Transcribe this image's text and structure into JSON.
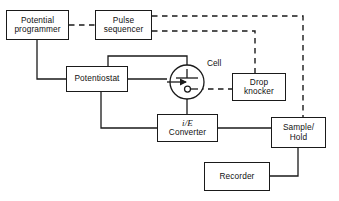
{
  "diagram": {
    "canvas": {
      "width": 339,
      "height": 201,
      "background": "#ffffff"
    },
    "line_colors": {
      "solid": "#1a1a1a",
      "dashed": "#1a1a1a"
    },
    "nodes": [
      {
        "id": "potential-programmer",
        "label_lines": [
          "Potential",
          "programmer"
        ],
        "x": 6,
        "y": 10,
        "w": 63,
        "h": 30
      },
      {
        "id": "pulse-sequencer",
        "label_lines": [
          "Pulse",
          "sequencer"
        ],
        "x": 95,
        "y": 10,
        "w": 57,
        "h": 30
      },
      {
        "id": "potentiostat",
        "label_lines": [
          "Potentiostat"
        ],
        "x": 66,
        "y": 66,
        "w": 62,
        "h": 26
      },
      {
        "id": "drop-knocker",
        "label_lines": [
          "Drop",
          "knocker"
        ],
        "x": 232,
        "y": 73,
        "w": 54,
        "h": 28
      },
      {
        "id": "ie-converter",
        "label_lines": [
          "i/E",
          "Converter"
        ],
        "italic_first_line": true,
        "x": 157,
        "y": 114,
        "w": 61,
        "h": 28
      },
      {
        "id": "sample-hold",
        "label_lines": [
          "Sample/",
          "Hold"
        ],
        "x": 271,
        "y": 117,
        "w": 55,
        "h": 31
      },
      {
        "id": "recorder",
        "label_lines": [
          "Recorder"
        ],
        "x": 204,
        "y": 162,
        "w": 66,
        "h": 29
      }
    ],
    "cell": {
      "id": "cell",
      "label": "Cell",
      "label_x": 207,
      "label_y": 63,
      "cx": 187,
      "cy": 82,
      "r": 17
    },
    "connections": [
      {
        "from": "potential-programmer",
        "to": "pulse-sequencer",
        "style": "dashed"
      },
      {
        "from": "potential-programmer",
        "to": "potentiostat",
        "style": "solid"
      },
      {
        "from": "pulse-sequencer",
        "to": "sample-hold",
        "style": "dashed"
      },
      {
        "from": "pulse-sequencer",
        "to": "drop-knocker",
        "style": "dashed"
      },
      {
        "from": "cell",
        "to": "drop-knocker",
        "style": "dashed"
      },
      {
        "from": "potentiostat",
        "to": "cell",
        "style": "solid"
      },
      {
        "from": "potentiostat",
        "to": "cell-top-electrode",
        "style": "solid"
      },
      {
        "from": "potentiostat",
        "to": "ie-converter",
        "style": "solid"
      },
      {
        "from": "cell",
        "to": "ie-converter",
        "style": "solid"
      },
      {
        "from": "ie-converter",
        "to": "sample-hold",
        "style": "solid"
      },
      {
        "from": "sample-hold",
        "to": "recorder",
        "style": "solid"
      }
    ]
  }
}
